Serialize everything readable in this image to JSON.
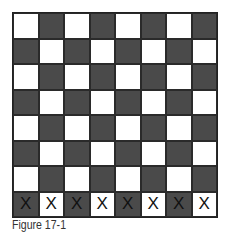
{
  "figure": {
    "caption": "Figure 17-1",
    "board": {
      "rows": 8,
      "cols": 8,
      "top_left_color": "light",
      "colors": {
        "dark": "#4a4a4a",
        "light": "#ffffff"
      },
      "marked_row_index": 7,
      "marks": [
        "X",
        "X",
        "X",
        "X",
        "X",
        "X",
        "X",
        "X"
      ]
    }
  }
}
